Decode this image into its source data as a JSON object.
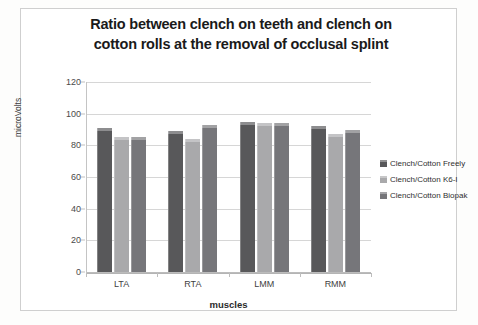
{
  "chart_data": {
    "type": "bar",
    "title": "Ratio between clench on teeth and clench on cotton rolls at the removal of occlusal splint",
    "title_line1": "Ratio between clench on teeth and clench on",
    "title_line2": "cotton rolls at the removal of occlusal splint",
    "xlabel": "muscles",
    "ylabel": "microVolts",
    "categories": [
      "LTA",
      "RTA",
      "LMM",
      "RMM"
    ],
    "ylim": [
      0,
      120
    ],
    "yticks": [
      0,
      20,
      40,
      60,
      80,
      100,
      120
    ],
    "grid": true,
    "legend_position": "right",
    "series": [
      {
        "name": "Clench/Cotton Freely",
        "color": "#58585a",
        "values": [
          91,
          89,
          95,
          92
        ]
      },
      {
        "name": "Clench/Cotton K6-I",
        "color": "#a9a9ab",
        "values": [
          85,
          84,
          94,
          87
        ]
      },
      {
        "name": "Clench/Cotton Biopak",
        "color": "#76767a",
        "values": [
          85,
          93,
          94,
          90
        ]
      }
    ]
  }
}
